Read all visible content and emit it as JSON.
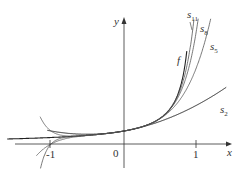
{
  "figure": {
    "axes": {
      "x_label": "x",
      "y_label": "y",
      "origin_label": "0",
      "tick_labels": [
        "-1",
        "1"
      ]
    },
    "curves": [
      {
        "name": "f",
        "label": "f"
      },
      {
        "name": "s2",
        "label": "s",
        "sub": "2"
      },
      {
        "name": "s5",
        "label": "s",
        "sub": "5"
      },
      {
        "name": "s8",
        "label": "s",
        "sub": "8"
      },
      {
        "name": "s11",
        "label": "s",
        "sub": "11"
      }
    ],
    "colors": {
      "axis": "#333333",
      "f": "#222222",
      "partial_sums": "#555555",
      "s2": "#222222"
    }
  },
  "chart_data": {
    "type": "line",
    "title": "",
    "xlabel": "x",
    "ylabel": "y",
    "xlim": [
      -1.6,
      1.4
    ],
    "x_ticks": [
      -1,
      0,
      1
    ],
    "series": [
      {
        "name": "f",
        "formula": "1/(1-x)"
      },
      {
        "name": "s2",
        "formula": "1 + x + x^2"
      },
      {
        "name": "s5",
        "formula": "sum_{n=0}^{5} x^n"
      },
      {
        "name": "s8",
        "formula": "sum_{n=0}^{8} x^n"
      },
      {
        "name": "s11",
        "formula": "sum_{n=0}^{11} x^n"
      }
    ],
    "grid": false,
    "legend": "inline labels"
  }
}
